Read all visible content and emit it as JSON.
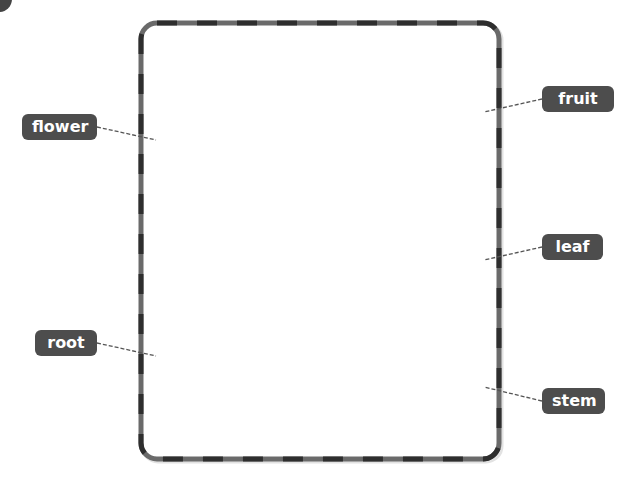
{
  "diagram": {
    "type": "plant-parts-labeling",
    "frame": {
      "shape": "rounded-rectangle",
      "border_style": "dashed-two-tone",
      "border_colors": [
        "#2e2e2e",
        "#6a6a6a"
      ],
      "fill": "#ffffff"
    },
    "labels": [
      {
        "id": "flower",
        "text": "flower",
        "side": "left"
      },
      {
        "id": "root",
        "text": "root",
        "side": "left"
      },
      {
        "id": "fruit",
        "text": "fruit",
        "side": "right"
      },
      {
        "id": "leaf",
        "text": "leaf",
        "side": "right"
      },
      {
        "id": "stem",
        "text": "stem",
        "side": "right"
      }
    ],
    "label_style": {
      "background": "#4d4d4d",
      "text_color": "#ffffff"
    },
    "leader_line_color": "#555555"
  }
}
